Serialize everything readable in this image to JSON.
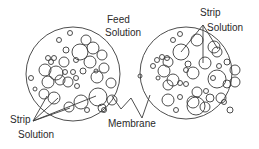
{
  "diagram": {
    "labels": {
      "feed_line1": "Feed",
      "feed_line2": "Solution",
      "strip_top_line1": "Strip",
      "strip_top_line2": "Solution",
      "strip_bottom_line1": "Strip",
      "strip_bottom_line2": "Solution",
      "membrane": "Membrane"
    },
    "colors": {
      "stroke": "#3a3a3a",
      "text": "#2a2a2a",
      "background": "#ffffff"
    },
    "droplets_left": [
      [
        70,
        33,
        2.5
      ],
      [
        59,
        40,
        2.5
      ],
      [
        86,
        40,
        5
      ],
      [
        80,
        52,
        8
      ],
      [
        93,
        48,
        6
      ],
      [
        102,
        55,
        5
      ],
      [
        66,
        50,
        3
      ],
      [
        48,
        58,
        2.5
      ],
      [
        54,
        58,
        2.5
      ],
      [
        51,
        62,
        2.5
      ],
      [
        64,
        62,
        5
      ],
      [
        76,
        60,
        2.5
      ],
      [
        90,
        62,
        6
      ],
      [
        104,
        68,
        5
      ],
      [
        96,
        71,
        2
      ],
      [
        60,
        80,
        5
      ],
      [
        56,
        73,
        7
      ],
      [
        68,
        82,
        5
      ],
      [
        76,
        78,
        2.5
      ],
      [
        65,
        72,
        2.5
      ],
      [
        73,
        72,
        2.5
      ],
      [
        83,
        71,
        3
      ],
      [
        97,
        77,
        6
      ],
      [
        111,
        83,
        5
      ],
      [
        31,
        78,
        2.5
      ],
      [
        45,
        70,
        6
      ],
      [
        48,
        82,
        6
      ],
      [
        44,
        94,
        5
      ],
      [
        54,
        98,
        6
      ],
      [
        69,
        107,
        5
      ],
      [
        81,
        102,
        7
      ],
      [
        98,
        97,
        9
      ],
      [
        87,
        110,
        2.5
      ],
      [
        102,
        108,
        4
      ],
      [
        112,
        100,
        5
      ],
      [
        104,
        110,
        2.5
      ],
      [
        35,
        89,
        2
      ],
      [
        77,
        86,
        2.5
      ]
    ],
    "droplets_right": [
      [
        180,
        34,
        2.5
      ],
      [
        173,
        40,
        2.5
      ],
      [
        197,
        40,
        6
      ],
      [
        181,
        52,
        8
      ],
      [
        214,
        47,
        6
      ],
      [
        217,
        52,
        5
      ],
      [
        162,
        57,
        2.5
      ],
      [
        157,
        60,
        2.5
      ],
      [
        167,
        58,
        2.5
      ],
      [
        153,
        66,
        2.5
      ],
      [
        168,
        62,
        5
      ],
      [
        188,
        64,
        3
      ],
      [
        205,
        63,
        6
      ],
      [
        219,
        66,
        2.5
      ],
      [
        227,
        62,
        3
      ],
      [
        164,
        71,
        6
      ],
      [
        173,
        80,
        6
      ],
      [
        186,
        70,
        2.5
      ],
      [
        193,
        73,
        6
      ],
      [
        217,
        79,
        9
      ],
      [
        213,
        78,
        2.5
      ],
      [
        235,
        70,
        5
      ],
      [
        227,
        84,
        4
      ],
      [
        235,
        82,
        5
      ],
      [
        158,
        78,
        2
      ],
      [
        168,
        85,
        5
      ],
      [
        180,
        83,
        2.5
      ],
      [
        186,
        84,
        2.5
      ],
      [
        197,
        92,
        5
      ],
      [
        206,
        91,
        2.5
      ],
      [
        168,
        100,
        6
      ],
      [
        180,
        97,
        2.5
      ],
      [
        193,
        102,
        6
      ],
      [
        205,
        107,
        5
      ],
      [
        196,
        106,
        9
      ],
      [
        210,
        98,
        4
      ],
      [
        221,
        98,
        5
      ],
      [
        224,
        102,
        2.5
      ],
      [
        230,
        110,
        3
      ],
      [
        176,
        110,
        2.5
      ],
      [
        140,
        76,
        2
      ]
    ]
  }
}
